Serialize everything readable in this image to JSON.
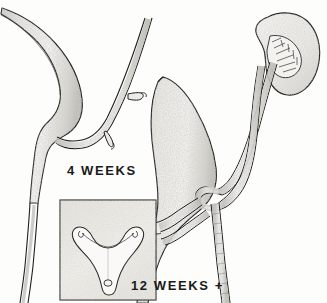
{
  "figure": {
    "background_color": "#fdfdfc",
    "ink_color": "#1a1a1a",
    "shading_color": "#b9b9b4",
    "panels": [
      {
        "id": "panel-4-weeks",
        "caption": "4 WEEKS",
        "structures": [
          "urogenital-sinus",
          "allantois-urachus",
          "mesonephric-wolffian-duct",
          "ureteric-bud-upper",
          "ureteric-bud-lower"
        ]
      },
      {
        "id": "panel-12-weeks",
        "caption": "12 WEEKS +",
        "structures": [
          "bladder",
          "urachus",
          "kidney",
          "ureter-upper-pole",
          "ureter-lower-pole",
          "crossing-ureters",
          "mesonephric-duct-remnant",
          "urethra"
        ]
      }
    ],
    "inset": {
      "id": "trigone-inset",
      "structures": [
        "bladder-trigone",
        "ureteral-orifice-left",
        "ureteral-orifice-right",
        "urethral-orifice"
      ]
    },
    "captions": {
      "four_weeks": "4 WEEKS",
      "twelve_weeks": "12 WEEKS +"
    }
  }
}
